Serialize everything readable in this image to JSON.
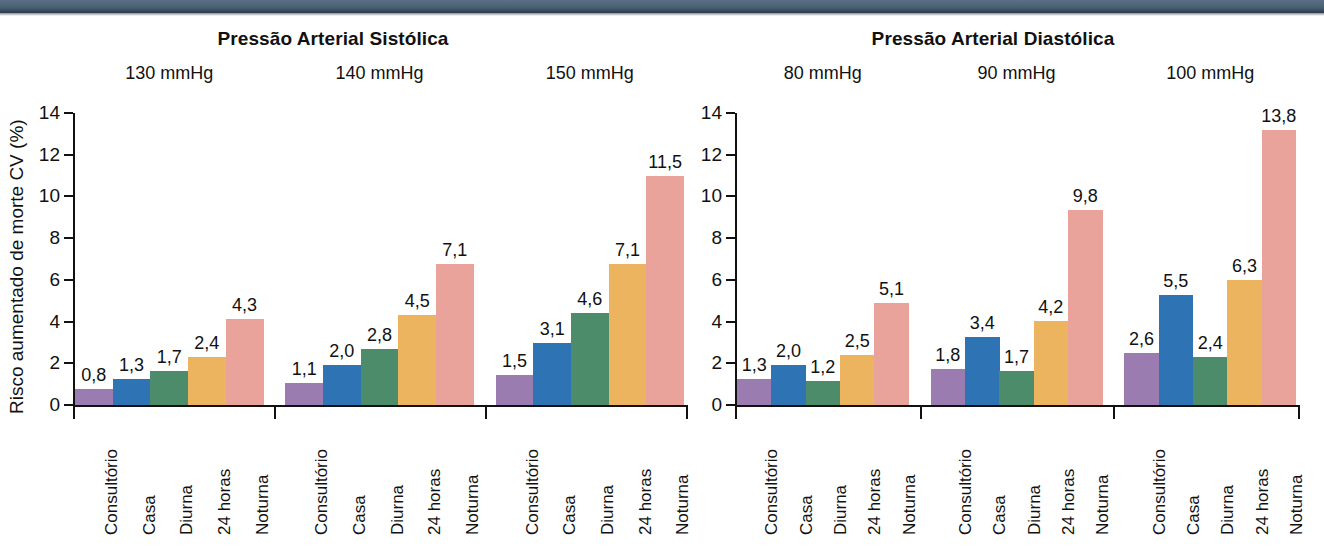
{
  "figure": {
    "ylabel": "Risco aumentado de morte CV (%)",
    "ytick_labels": [
      "0",
      "2",
      "4",
      "6",
      "8",
      "10",
      "12",
      "14"
    ]
  },
  "colors": {
    "consultorio": "#9B7CB0",
    "casa": "#2E74B5",
    "diurna": "#4C8C6B",
    "24horas": "#EDB45F",
    "noturna": "#E9A39B",
    "header_band": "#4a6073",
    "axis": "#111111"
  },
  "chart_data": [
    {
      "type": "bar",
      "title": "Pressão Arterial Sistólica",
      "xlabel": "",
      "ylabel": "Risco aumentado de morte CV (%)",
      "ylim": [
        0,
        14
      ],
      "yticks": [
        0,
        2,
        4,
        6,
        8,
        10,
        12,
        14
      ],
      "grid": false,
      "legend": "none",
      "categories": [
        "Consultório",
        "Casa",
        "Diurna",
        "24 horas",
        "Noturna"
      ],
      "groups": [
        {
          "label": "130 mmHg",
          "values": [
            0.8,
            1.3,
            1.7,
            2.4,
            4.3
          ],
          "value_labels": [
            "0,8",
            "1,3",
            "1,7",
            "2,4",
            "4,3"
          ]
        },
        {
          "label": "140 mmHg",
          "values": [
            1.1,
            2.0,
            2.8,
            4.5,
            7.1
          ],
          "value_labels": [
            "1,1",
            "2,0",
            "2,8",
            "4,5",
            "7,1"
          ]
        },
        {
          "label": "150 mmHg",
          "values": [
            1.5,
            3.1,
            4.6,
            7.1,
            11.5
          ],
          "value_labels": [
            "1,5",
            "3,1",
            "4,6",
            "7,1",
            "11,5"
          ]
        }
      ]
    },
    {
      "type": "bar",
      "title": "Pressão Arterial Diastólica",
      "xlabel": "",
      "ylabel": "",
      "ylim": [
        0,
        14
      ],
      "yticks": [
        0,
        2,
        4,
        6,
        8,
        10,
        12,
        14
      ],
      "grid": false,
      "legend": "none",
      "categories": [
        "Consultório",
        "Casa",
        "Diurna",
        "24 horas",
        "Noturna"
      ],
      "groups": [
        {
          "label": "80 mmHg",
          "values": [
            1.3,
            2.0,
            1.2,
            2.5,
            5.1
          ],
          "value_labels": [
            "1,3",
            "2,0",
            "1,2",
            "2,5",
            "5,1"
          ]
        },
        {
          "label": "90 mmHg",
          "values": [
            1.8,
            3.4,
            1.7,
            4.2,
            9.8
          ],
          "value_labels": [
            "1,8",
            "3,4",
            "1,7",
            "4,2",
            "9,8"
          ]
        },
        {
          "label": "100 mmHg",
          "values": [
            2.6,
            5.5,
            2.4,
            6.3,
            13.8
          ],
          "value_labels": [
            "2,6",
            "5,5",
            "2,4",
            "6,3",
            "13,8"
          ]
        }
      ]
    }
  ]
}
